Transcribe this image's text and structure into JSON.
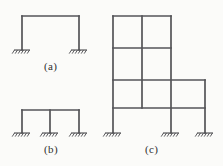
{
  "figure": {
    "background_color": "#fbfbf9",
    "line_color": "#545458",
    "hatch_color": "#4a4a4e",
    "text_color": "#2e2e2e",
    "width": 223,
    "height": 166
  },
  "captions": {
    "a": "(a)",
    "b": "(b)",
    "c": "(c)"
  },
  "frames": [
    {
      "id": "a",
      "label": "(a)",
      "bays": 1,
      "stories": 1,
      "supports": 2,
      "column_x": [
        22,
        79
      ],
      "support_y": 50,
      "beam_y": [
        16
      ],
      "support_x": [
        22,
        79
      ]
    },
    {
      "id": "b",
      "label": "(b)",
      "bays": 2,
      "stories": 1,
      "supports": 3,
      "column_x": [
        22,
        50,
        79
      ],
      "support_y": 133,
      "beam_y": [
        110
      ],
      "support_x": [
        22,
        50,
        79
      ]
    },
    {
      "id": "c",
      "label": "(c)",
      "bays": 3,
      "stories": 4,
      "supports": 3,
      "column_x": [
        113,
        142,
        171,
        205
      ],
      "support_y": 133,
      "beam_y": [
        16,
        48,
        80,
        108
      ],
      "support_x": [
        113,
        171,
        205
      ]
    }
  ],
  "support_symbol": {
    "name": "fixed-support-hatch",
    "ground_line_width": 16,
    "hatch_count": 6,
    "hatch_angle_deg": 60
  },
  "colors": {
    "line": "#545458",
    "hatch": "#4a4a4e",
    "text": "#2e2e2e",
    "paper": "#fbfbf9"
  }
}
